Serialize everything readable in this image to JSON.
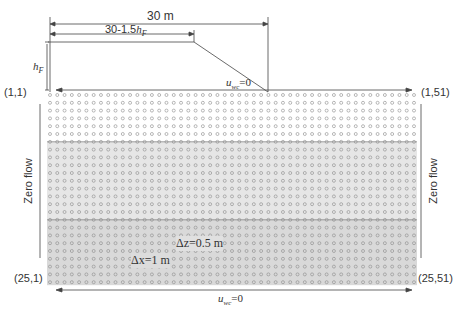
{
  "diagram": {
    "grid": {
      "rows": 25,
      "cols": 51,
      "x0": 50,
      "y0": 95,
      "dx": 7.28,
      "dy": 7.8
    },
    "bands": [
      {
        "from_row": 1,
        "to_row": 7,
        "color": "#ffffff"
      },
      {
        "from_row": 7,
        "to_row": 17,
        "color": "#e6e6e6"
      },
      {
        "from_row": 17,
        "to_row": 25,
        "color": "#d9d9d9"
      }
    ],
    "colors": {
      "node": "#8a8a8a",
      "line": "#444444",
      "band_line": "#777777"
    }
  },
  "labels": {
    "width_total": "30 m",
    "width_top": "30-1.5",
    "width_top_var": "h",
    "width_top_sub": "F",
    "height_var": "h",
    "height_sub": "F",
    "corner_tl": "(1,1)",
    "corner_tr": "(1,51)",
    "corner_bl": "(25,1)",
    "corner_br": "(25,51)",
    "top_bc_var": "u",
    "top_bc_sub": "wc",
    "top_bc_val": "=0",
    "bottom_bc_var": "u",
    "bottom_bc_sub": "wc",
    "bottom_bc_val": "=0",
    "left_bc": "Zero flow",
    "right_bc": "Zero flow",
    "dz": "Δz=0.5 m",
    "dx": "Δx=1 m"
  }
}
